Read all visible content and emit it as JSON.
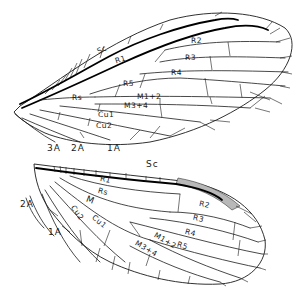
{
  "diagram": {
    "forewing": {
      "labels": {
        "sc": "Sc",
        "r1": "R1",
        "r2": "R2",
        "r3": "R3",
        "r4": "R4",
        "r5": "R5",
        "rs": "Rs",
        "m12": "M1+2",
        "m34": "M3+4",
        "cu1": "Cu1",
        "cu2": "Cu2",
        "a3": "3A",
        "a2": "2A",
        "a1": "1A"
      }
    },
    "hindwing": {
      "labels": {
        "sc": "Sc",
        "r1": "R1",
        "rs": "Rs",
        "m": "M",
        "cu2": "Cu2",
        "cu1": "Cu1",
        "a2": "2A",
        "a1": "1A",
        "r2": "R2",
        "r3": "R3",
        "r4": "R4",
        "r5": "R5",
        "m12": "M1+2",
        "m34": "M3+4"
      }
    },
    "colors": {
      "ink": "#1a1a1a",
      "stigma": "#b8b8b8",
      "background": "#ffffff"
    }
  }
}
